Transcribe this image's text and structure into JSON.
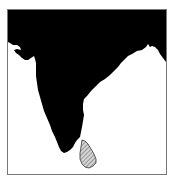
{
  "map": {
    "type": "locator-map",
    "highlighted_region": "Sri Lanka",
    "context_region": "India (Indian subcontinent)",
    "colors": {
      "land": "#000000",
      "water": "#ffffff",
      "highlight_fill": "#b8b8b8",
      "highlight_outline": "#333333",
      "frame": "#777777"
    }
  }
}
